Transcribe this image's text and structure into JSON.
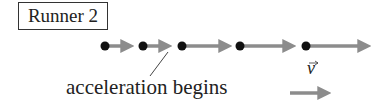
{
  "title": "Runner 2",
  "annotation": "acceleration begins",
  "vector_label": "v",
  "colors": {
    "arrow": "#8c8c8c",
    "dot": "#111111",
    "line": "#444444"
  },
  "motion_diagram": {
    "dots_x": [
      105,
      143,
      182,
      240,
      306
    ],
    "y": 46,
    "acceleration_begins_after_dot": 2
  }
}
